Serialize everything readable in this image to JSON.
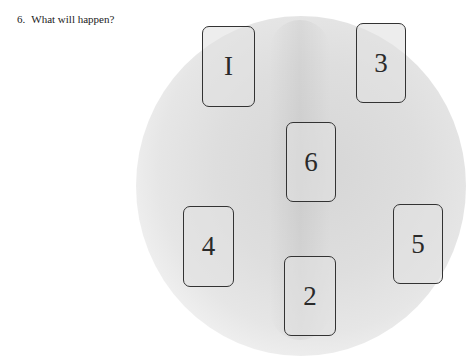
{
  "question": {
    "number": "6.",
    "text": "What will happen?"
  },
  "cards": [
    {
      "label": "I",
      "position": 1,
      "x": 202,
      "y": 26,
      "w": 53,
      "h": 81
    },
    {
      "label": "3",
      "position": 3,
      "x": 356,
      "y": 23,
      "w": 50,
      "h": 80
    },
    {
      "label": "6",
      "position": 6,
      "x": 286,
      "y": 122,
      "w": 50,
      "h": 80
    },
    {
      "label": "4",
      "position": 4,
      "x": 183,
      "y": 206,
      "w": 51,
      "h": 81
    },
    {
      "label": "5",
      "position": 5,
      "x": 393,
      "y": 204,
      "w": 50,
      "h": 80
    },
    {
      "label": "2",
      "position": 2,
      "x": 284,
      "y": 256,
      "w": 52,
      "h": 80
    }
  ]
}
